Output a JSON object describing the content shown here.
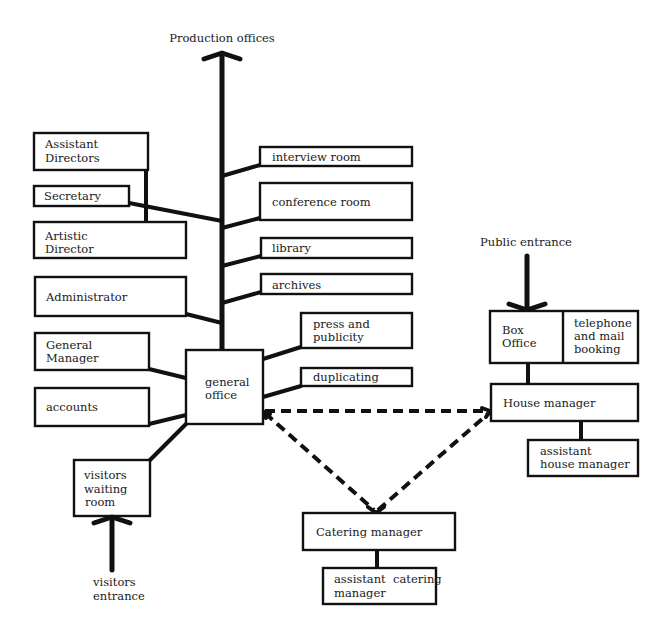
{
  "diagram": {
    "type": "organizational-layout",
    "colors": {
      "line": "#111111",
      "background": "#ffffff",
      "text": "#1a1a1a"
    },
    "external_labels": {
      "production_offices": "Production offices",
      "public_entrance": "Public entrance",
      "visitors_entrance_1": "visitors",
      "visitors_entrance_2": "entrance"
    },
    "left_nodes": {
      "assistant_directors": [
        "Assistant",
        "Directors"
      ],
      "secretary": [
        "Secretary"
      ],
      "artistic_director": [
        "Artistic",
        "Director"
      ],
      "administrator": [
        "Administrator"
      ],
      "general_manager": [
        "General",
        "Manager"
      ],
      "accounts": [
        "accounts"
      ],
      "visitors_waiting_room": [
        "visitors",
        "waiting",
        "room"
      ]
    },
    "hub": {
      "general_office": [
        "general",
        "office"
      ]
    },
    "right_nodes": {
      "interview_room": [
        "interview room"
      ],
      "conference_room": [
        "conference room"
      ],
      "library": [
        "library"
      ],
      "archives": [
        "archives"
      ],
      "press_and_publicity": [
        "press and",
        "publicity"
      ],
      "duplicating": [
        "duplicating"
      ]
    },
    "front_of_house": {
      "box_office": [
        "Box",
        "Office"
      ],
      "telephone_mail_booking": [
        "telephone",
        "and mail",
        "booking"
      ],
      "house_manager": [
        "House manager"
      ],
      "assistant_house_manager": [
        "assistant",
        "house manager"
      ]
    },
    "catering": {
      "catering_manager": [
        "Catering manager"
      ],
      "assistant_catering_manager": [
        "assistant  catering",
        "manager"
      ]
    },
    "dashed_links": [
      [
        "general office",
        "House manager"
      ],
      [
        "general office",
        "Catering manager"
      ],
      [
        "Catering manager",
        "House manager"
      ]
    ]
  }
}
